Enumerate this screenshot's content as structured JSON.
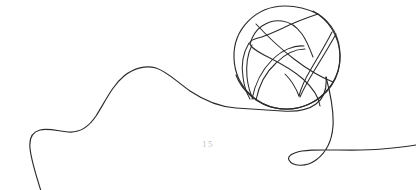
{
  "canvas": {
    "width": 416,
    "height": 190,
    "background_color": "#ffffff"
  },
  "artwork": {
    "title": "Continuous line art basketball",
    "style": "single-line-drawing",
    "stroke_color": "#2b2b2b",
    "stroke_width": 1.15,
    "elements": [
      {
        "name": "flowing-line",
        "description": "continuous curving line entering bottom-left and exiting right edge"
      },
      {
        "name": "basketball",
        "description": "circular ball with crossing seam lines, upper-right of canvas"
      }
    ]
  },
  "basketball": {
    "center_x": 287,
    "center_y": 57,
    "radius_x": 53,
    "radius_y": 52
  },
  "page_number": {
    "label": "15",
    "color": "#c2c2c2",
    "x": 188,
    "y": 146
  }
}
